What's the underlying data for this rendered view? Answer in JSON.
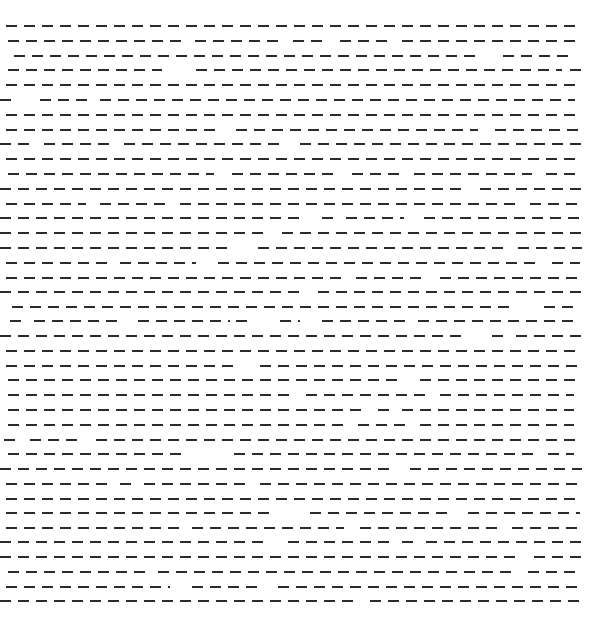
{
  "pattern": {
    "dash_color": "#2b2b2b",
    "background": "#ffffff",
    "dash_length": 11,
    "dash_period": 18,
    "dash_thickness": 2,
    "rows": [
      {
        "y": 26,
        "segments": [
          [
            6,
            580
          ]
        ]
      },
      {
        "y": 41,
        "segments": [
          [
            8,
            182
          ],
          [
            195,
            280
          ],
          [
            293,
            322
          ],
          [
            340,
            388
          ],
          [
            402,
            578
          ]
        ]
      },
      {
        "y": 56,
        "segments": [
          [
            14,
            478
          ],
          [
            503,
            572
          ]
        ]
      },
      {
        "y": 70,
        "segments": [
          [
            8,
            162
          ],
          [
            196,
            562
          ],
          [
            570,
            578
          ]
        ]
      },
      {
        "y": 85,
        "segments": [
          [
            6,
            580
          ]
        ]
      },
      {
        "y": 100,
        "segments": [
          [
            0,
            12
          ],
          [
            40,
            88
          ],
          [
            100,
            575
          ]
        ]
      },
      {
        "y": 115,
        "segments": [
          [
            6,
            580
          ]
        ]
      },
      {
        "y": 130,
        "segments": [
          [
            6,
            218
          ],
          [
            236,
            478
          ],
          [
            495,
            582
          ]
        ]
      },
      {
        "y": 144,
        "segments": [
          [
            0,
            32
          ],
          [
            44,
            112
          ],
          [
            124,
            282
          ],
          [
            300,
            582
          ]
        ]
      },
      {
        "y": 159,
        "segments": [
          [
            6,
            580
          ]
        ]
      },
      {
        "y": 174,
        "segments": [
          [
            8,
            214
          ],
          [
            232,
            334
          ],
          [
            352,
            400
          ],
          [
            414,
            532
          ],
          [
            546,
            578
          ]
        ]
      },
      {
        "y": 189,
        "segments": [
          [
            0,
            466
          ],
          [
            480,
            582
          ]
        ]
      },
      {
        "y": 204,
        "segments": [
          [
            6,
            86
          ],
          [
            100,
            168
          ],
          [
            180,
            516
          ],
          [
            530,
            580
          ]
        ]
      },
      {
        "y": 218,
        "segments": [
          [
            0,
            302
          ],
          [
            322,
            330
          ],
          [
            346,
            404
          ],
          [
            424,
            582
          ]
        ]
      },
      {
        "y": 233,
        "segments": [
          [
            0,
            270
          ],
          [
            282,
            582
          ]
        ]
      },
      {
        "y": 248,
        "segments": [
          [
            0,
            232
          ],
          [
            258,
            504
          ],
          [
            518,
            582
          ]
        ]
      },
      {
        "y": 263,
        "segments": [
          [
            6,
            108
          ],
          [
            120,
            196
          ],
          [
            218,
            538
          ],
          [
            552,
            580
          ]
        ]
      },
      {
        "y": 278,
        "segments": [
          [
            6,
            344
          ],
          [
            356,
            422
          ],
          [
            440,
            582
          ]
        ]
      },
      {
        "y": 292,
        "segments": [
          [
            0,
            304
          ],
          [
            318,
            582
          ]
        ]
      },
      {
        "y": 307,
        "segments": [
          [
            12,
            514
          ],
          [
            544,
            574
          ]
        ]
      },
      {
        "y": 321,
        "segments": [
          [
            10,
            22
          ],
          [
            34,
            120
          ],
          [
            138,
            230
          ],
          [
            236,
            248
          ],
          [
            280,
            300
          ],
          [
            322,
            406
          ],
          [
            418,
            574
          ]
        ]
      },
      {
        "y": 336,
        "segments": [
          [
            0,
            466
          ],
          [
            492,
            504
          ],
          [
            516,
            582
          ]
        ]
      },
      {
        "y": 351,
        "segments": [
          [
            6,
            580
          ]
        ]
      },
      {
        "y": 366,
        "segments": [
          [
            6,
            236
          ],
          [
            260,
            580
          ]
        ]
      },
      {
        "y": 380,
        "segments": [
          [
            8,
            398
          ],
          [
            420,
            576
          ]
        ]
      },
      {
        "y": 395,
        "segments": [
          [
            8,
            292
          ],
          [
            306,
            426
          ],
          [
            440,
            574
          ]
        ]
      },
      {
        "y": 410,
        "segments": [
          [
            8,
            364
          ],
          [
            378,
            392
          ],
          [
            402,
            574
          ]
        ]
      },
      {
        "y": 425,
        "segments": [
          [
            8,
            344
          ],
          [
            358,
            408
          ],
          [
            420,
            574
          ]
        ]
      },
      {
        "y": 440,
        "segments": [
          [
            4,
            20
          ],
          [
            30,
            80
          ],
          [
            96,
            582
          ]
        ]
      },
      {
        "y": 454,
        "segments": [
          [
            8,
            182
          ],
          [
            234,
            536
          ],
          [
            548,
            574
          ]
        ]
      },
      {
        "y": 469,
        "segments": [
          [
            0,
            396
          ],
          [
            410,
            582
          ]
        ]
      },
      {
        "y": 484,
        "segments": [
          [
            6,
            108
          ],
          [
            120,
            132
          ],
          [
            144,
            248
          ],
          [
            260,
            580
          ]
        ]
      },
      {
        "y": 499,
        "segments": [
          [
            6,
            580
          ]
        ]
      },
      {
        "y": 513,
        "segments": [
          [
            6,
            270
          ],
          [
            310,
            454
          ],
          [
            468,
            580
          ]
        ]
      },
      {
        "y": 528,
        "segments": [
          [
            6,
            180
          ],
          [
            192,
            344
          ],
          [
            360,
            500
          ],
          [
            512,
            580
          ]
        ]
      },
      {
        "y": 542,
        "segments": [
          [
            0,
            270
          ],
          [
            288,
            390
          ],
          [
            402,
            416
          ],
          [
            426,
            582
          ]
        ]
      },
      {
        "y": 557,
        "segments": [
          [
            0,
            516
          ],
          [
            534,
            582
          ]
        ]
      },
      {
        "y": 572,
        "segments": [
          [
            8,
            146
          ],
          [
            158,
            516
          ],
          [
            528,
            578
          ]
        ]
      },
      {
        "y": 587,
        "segments": [
          [
            6,
            170
          ],
          [
            192,
            260
          ],
          [
            278,
            580
          ]
        ]
      },
      {
        "y": 601,
        "segments": [
          [
            0,
            356
          ],
          [
            370,
            582
          ]
        ]
      }
    ]
  }
}
